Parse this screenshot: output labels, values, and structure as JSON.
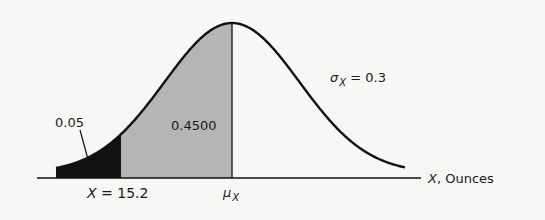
{
  "figure": {
    "type": "normal-distribution-diagram",
    "colors": {
      "background": "#f7f7f5",
      "curve": "#111111",
      "shaded_region": "#b5b5b5",
      "tail_region": "#111111"
    },
    "labels": {
      "tail_area": "0.05",
      "middle_area": "0.4500",
      "sigma_symbol": "σ",
      "sigma_sub": "X",
      "sigma_value": " = 0.3",
      "cutoff_var": "X",
      "cutoff_value": " = 15.2",
      "mean_symbol": "μ",
      "mean_sub": "X",
      "axis_var": "X",
      "axis_unit": ", Ounces"
    }
  },
  "chart_data": {
    "type": "area",
    "title": "",
    "xlabel": "X, Ounces",
    "ylabel": "",
    "distribution": "normal",
    "parameters": {
      "sigma": 0.3,
      "mean_label": "μX"
    },
    "regions": [
      {
        "name": "lower tail",
        "from": "-inf",
        "to": 15.2,
        "area": 0.05,
        "fill": "black"
      },
      {
        "name": "cutoff to mean",
        "from": 15.2,
        "to": "μX",
        "area": 0.45,
        "fill": "gray"
      }
    ],
    "annotations": [
      "0.05",
      "0.4500",
      "σX = 0.3",
      "X = 15.2",
      "μX",
      "X, Ounces"
    ],
    "grid": false
  }
}
